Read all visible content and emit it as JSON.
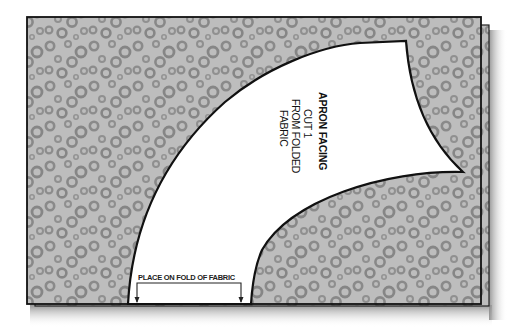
{
  "diagram": {
    "pattern_piece": {
      "name": "APRON FACING",
      "instructions": [
        "CUT 1",
        "FROM FOLDED",
        "FABRIC"
      ]
    },
    "fold_marker": {
      "label": "PLACE ON FOLD OF FABRIC"
    },
    "colors": {
      "fabric": "#bdbdbd",
      "fabric_dots": "#8a8a8a",
      "pattern_piece": "#ffffff",
      "outline": "#111111",
      "shadow": "#9a9a9a"
    }
  }
}
